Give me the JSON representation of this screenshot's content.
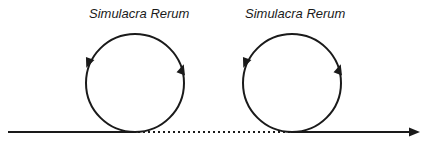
{
  "diagram": {
    "labels": {
      "left": "Simulacra Rerum",
      "right": "Simulacra Rerum"
    },
    "colors": {
      "stroke": "#1a1a1a",
      "background": "#ffffff"
    },
    "elements": [
      {
        "type": "solid-line",
        "from": [
          8,
          132
        ],
        "to": [
          136,
          132
        ]
      },
      {
        "type": "dotted-line",
        "from": [
          136,
          132
        ],
        "to": [
          292,
          132
        ]
      },
      {
        "type": "arrow-line",
        "from": [
          292,
          132
        ],
        "to": [
          420,
          132
        ]
      },
      {
        "type": "loop-circle",
        "center": [
          135,
          83
        ],
        "radius": 49,
        "direction": "counterclockwise"
      },
      {
        "type": "loop-circle",
        "center": [
          292,
          83
        ],
        "radius": 49,
        "direction": "counterclockwise"
      }
    ]
  }
}
